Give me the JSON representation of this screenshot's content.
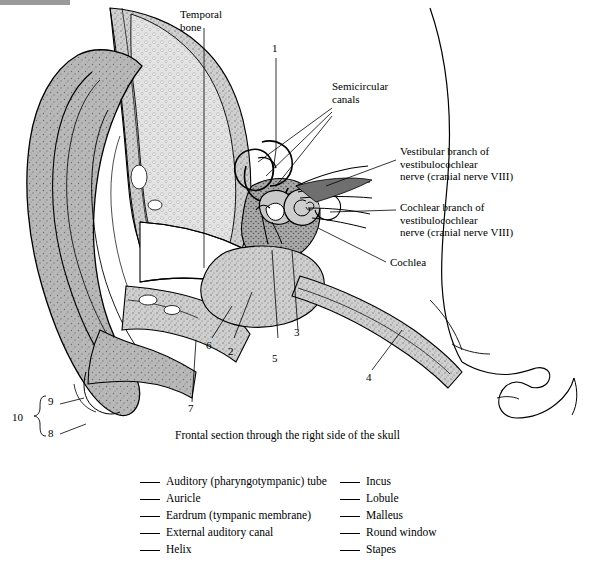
{
  "figure": {
    "caption": "Frontal section through the right side of the skull",
    "callout_labels": [
      {
        "id": "temporal-bone",
        "text": "Temporal\nbone"
      },
      {
        "id": "semicircular-canals",
        "text": "Semicircular\ncanals"
      },
      {
        "id": "vestibular-branch",
        "text": "Vestibular branch of\nvestibulocochlear\nnerve (cranial nerve VIII)"
      },
      {
        "id": "cochlear-branch",
        "text": "Cochlear branch of\nvestibulocochlear\nnerve (cranial nerve VIII)"
      },
      {
        "id": "cochlea",
        "text": "Cochlea"
      }
    ],
    "leader_numbers": [
      "1",
      "2",
      "3",
      "4",
      "5",
      "6",
      "7",
      "8",
      "9",
      "10"
    ]
  },
  "answer_key": {
    "column_left": [
      "Auditory (pharyngotympanic) tube",
      "Auricle",
      "Eardrum (tympanic membrane)",
      "External auditory canal",
      "Helix"
    ],
    "column_right": [
      "Incus",
      "Lobule",
      "Malleus",
      "Round window",
      "Stapes"
    ]
  },
  "colors": {
    "ink": "#000000",
    "tissue_gray": "#9a9a9a",
    "bone_gray": "#d9d9d9",
    "topbar": "#9a9a9a"
  }
}
